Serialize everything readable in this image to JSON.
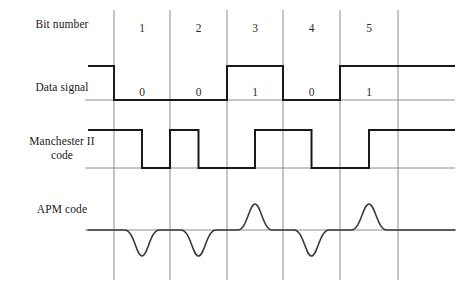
{
  "diagram": {
    "rows": [
      {
        "key": "bit_number",
        "label": "Bit number"
      },
      {
        "key": "data_signal",
        "label": "Data signal"
      },
      {
        "key": "manchester",
        "label": "Manchester II\ncode"
      },
      {
        "key": "apm",
        "label": "APM code"
      }
    ],
    "bit_numbers": [
      "1",
      "2",
      "3",
      "4",
      "5"
    ],
    "bit_values": [
      "0",
      "0",
      "1",
      "0",
      "1"
    ],
    "colors": {
      "grid": "#8c8c8c",
      "baseline": "#8c8c8c",
      "waveform": "#1a1a1a",
      "apm_waveform": "#3a3a3a",
      "background": "#ffffff",
      "text": "#2b2b2b"
    },
    "geometry": {
      "grid_x": [
        114,
        170,
        227,
        283,
        340,
        398
      ],
      "grid_top": 10,
      "grid_bottom": 280,
      "bit_width": 56.8,
      "data_high_y": 66,
      "data_low_y": 100,
      "manchester_high_y": 130,
      "manchester_low_y": 168,
      "apm_baseline_y": 230,
      "apm_amplitude": 26,
      "left_stub_x": 88,
      "right_stub_x": 455
    }
  },
  "chart_data": {
    "type": "line",
    "categories": [
      "1",
      "2",
      "3",
      "4",
      "5"
    ],
    "series": [
      {
        "name": "Data signal",
        "values": [
          0,
          0,
          1,
          0,
          1
        ]
      },
      {
        "name": "Manchester II code",
        "values": [
          0,
          0,
          1,
          0,
          1
        ]
      },
      {
        "name": "APM code",
        "values": [
          0,
          0,
          1,
          0,
          1
        ]
      }
    ],
    "xlabel": "Bit number",
    "ylabel": "",
    "grid": true,
    "legend": "none"
  }
}
